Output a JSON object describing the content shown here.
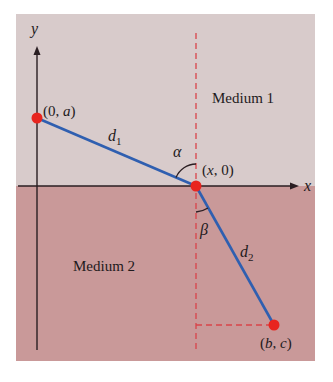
{
  "figure": {
    "regions": {
      "medium1": {
        "label": "Medium 1",
        "color": "#d8cbcb"
      },
      "medium2": {
        "label": "Medium 2",
        "color": "#c99999"
      }
    },
    "axes": {
      "x_label": "x",
      "y_label": "y",
      "color": "#2a1e22"
    },
    "points": [
      {
        "label": "(0, a)",
        "role": "start"
      },
      {
        "label": "(x, 0)",
        "role": "interface"
      },
      {
        "label": "(b, c)",
        "role": "end"
      }
    ],
    "segments": {
      "d1": {
        "label": "d",
        "subscript": "1"
      },
      "d2": {
        "label": "d",
        "subscript": "2"
      }
    },
    "angles": {
      "alpha": "α",
      "beta": "β"
    },
    "colors": {
      "path": "#2f5fb0",
      "point": "#e8251f",
      "dashed": "#d9444a"
    }
  }
}
